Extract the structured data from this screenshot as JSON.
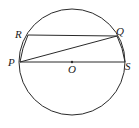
{
  "diagram": {
    "type": "geometry",
    "stroke_color": "#2a2a2a",
    "circle": {
      "center": "O",
      "cx": 72,
      "cy": 62,
      "r": 53
    },
    "points": [
      {
        "name": "R",
        "x": 28,
        "y": 35,
        "label_x": 15,
        "label_y": 38
      },
      {
        "name": "Q",
        "x": 117,
        "y": 36,
        "label_x": 116,
        "label_y": 35
      },
      {
        "name": "P",
        "x": 20,
        "y": 62,
        "label_x": 8,
        "label_y": 66
      },
      {
        "name": "S",
        "x": 125,
        "y": 62,
        "label_x": 125,
        "label_y": 70
      },
      {
        "name": "O",
        "x": 72,
        "y": 62,
        "label_x": 68,
        "label_y": 73
      }
    ],
    "segments": [
      "RQ",
      "PQ",
      "PS",
      "RP",
      "QS"
    ],
    "arcs": [
      "RP",
      "QS"
    ],
    "labels": {
      "R": "R",
      "Q": "Q",
      "P": "P",
      "S": "S",
      "O": "O"
    }
  }
}
